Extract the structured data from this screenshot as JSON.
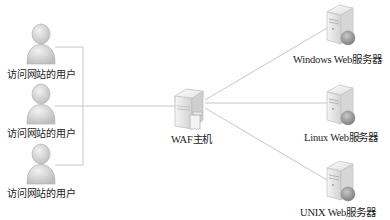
{
  "diagram": {
    "type": "network-topology",
    "users": [
      {
        "id": "user-1",
        "label": "访问网站的用户",
        "icon": "user-icon"
      },
      {
        "id": "user-2",
        "label": "访问网站的用户",
        "icon": "user-icon"
      },
      {
        "id": "user-3",
        "label": "访问网站的用户",
        "icon": "user-icon"
      }
    ],
    "waf": {
      "id": "waf-host",
      "label": "WAF主机",
      "icon": "firewall-server-icon"
    },
    "servers": [
      {
        "id": "windows-server",
        "label": "Windows Web服务器",
        "icon": "web-server-icon"
      },
      {
        "id": "linux-server",
        "label": "Linux Web服务器",
        "icon": "web-server-icon"
      },
      {
        "id": "unix-server",
        "label": "UNIX Web服务器",
        "icon": "web-server-icon"
      }
    ],
    "edges": [
      {
        "from": "user-1",
        "to": "waf-host"
      },
      {
        "from": "user-2",
        "to": "waf-host"
      },
      {
        "from": "user-3",
        "to": "waf-host"
      },
      {
        "from": "waf-host",
        "to": "windows-server"
      },
      {
        "from": "waf-host",
        "to": "linux-server"
      },
      {
        "from": "waf-host",
        "to": "unix-server"
      }
    ],
    "colors": {
      "line": "#c8c8c8",
      "icon": "#d9d9d9",
      "text": "#222222"
    }
  }
}
